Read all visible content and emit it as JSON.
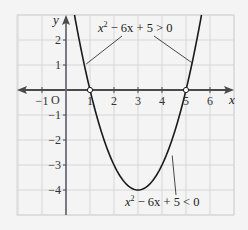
{
  "chart_data": {
    "type": "line",
    "title": "",
    "function": "y = x^2 - 6x + 5",
    "coefficients": {
      "a": 1,
      "b": -6,
      "c": 5
    },
    "xlabel": "x",
    "ylabel": "y",
    "origin_label": "O",
    "xlim": [
      -2,
      7
    ],
    "ylim": [
      -5,
      3
    ],
    "grid": true,
    "x_ticks": [
      -1,
      1,
      2,
      3,
      4,
      5,
      6
    ],
    "x_tick_labels": [
      "−1",
      "1",
      "2",
      "3",
      "4",
      "5",
      "6"
    ],
    "y_ticks": [
      2,
      1,
      -1,
      -2,
      -3,
      -4
    ],
    "y_tick_labels": [
      "2",
      "1",
      "−1",
      "−2",
      "−3",
      "−4"
    ],
    "roots": [
      1,
      5
    ],
    "vertex": [
      3,
      -4
    ],
    "annotations": [
      {
        "id": "positive",
        "text_pre": "x",
        "sup": "2",
        "text_post": " − 6x + 5 > 0",
        "targets": [
          [
            0.8,
            1.04
          ],
          [
            5.25,
            1.06
          ]
        ]
      },
      {
        "id": "negative",
        "text_pre": "x",
        "sup": "2",
        "text_post": " − 6x + 5 < 0",
        "targets": [
          [
            4.3,
            -2.5
          ]
        ]
      }
    ],
    "colors": {
      "background": "#f4f4f4",
      "grid": "#d6d6d6",
      "axis": "#4a4a4a",
      "curve": "#1a1a1a",
      "leader": "#333333"
    }
  }
}
